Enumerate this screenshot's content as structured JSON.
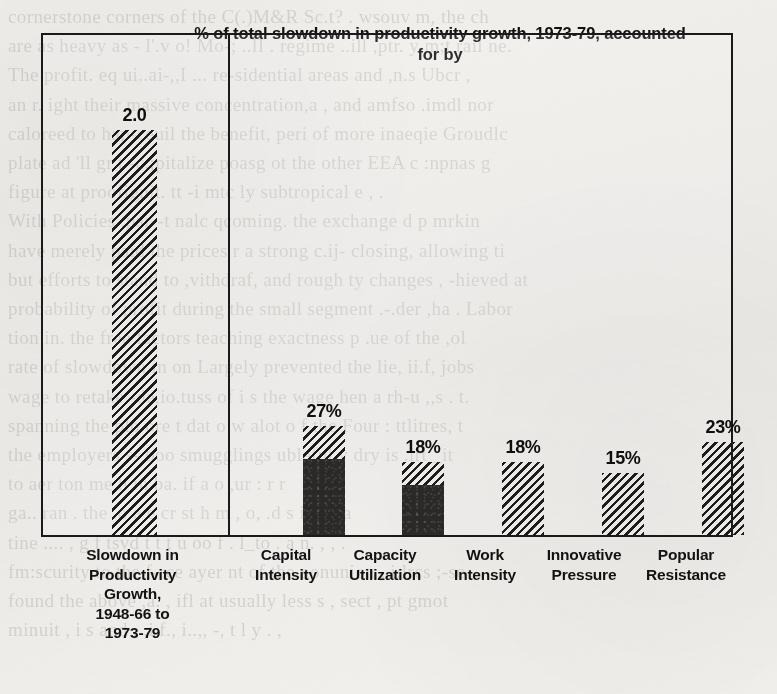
{
  "figure": {
    "panel_left": {
      "bars": [
        {
          "id": "slowdown-total",
          "value_label": "2.0",
          "value": 2.0,
          "fill": "hatched",
          "category": [
            "Slowdown in",
            "Productivity",
            "Growth,",
            "1948-66 to",
            "1973-79"
          ]
        }
      ]
    },
    "panel_right": {
      "title": "% of total slowdown in productivity growth, 1973-79, accounted for by",
      "title_line1": "% of total slowdown in productivity growth, 1973-79,",
      "title_line2": "accounted for by",
      "bars": [
        {
          "id": "capital-intensity",
          "value_label": "27%",
          "value": 27,
          "fill": "hatched-over-solid",
          "solid_fraction": 0.7,
          "category": [
            "Capital",
            "Intensity"
          ]
        },
        {
          "id": "capacity-utilization",
          "value_label": "18%",
          "value": 18,
          "fill": "hatched-over-solid",
          "solid_fraction": 0.69,
          "category": [
            "Capacity",
            "Utilization"
          ]
        },
        {
          "id": "work-intensity",
          "value_label": "18%",
          "value": 18,
          "fill": "hatched",
          "solid_fraction": 0,
          "category": [
            "Work",
            "Intensity"
          ]
        },
        {
          "id": "innovative-pressure",
          "value_label": "15%",
          "value": 15,
          "fill": "hatched",
          "solid_fraction": 0,
          "category": [
            "Innovative",
            "Pressure"
          ]
        },
        {
          "id": "popular-resistance",
          "value_label": "23%",
          "value": 23,
          "fill": "hatched",
          "solid_fraction": 0,
          "category": [
            "Popular",
            "Resistance"
          ]
        }
      ]
    }
  },
  "chart_data": {
    "type": "bar",
    "title": "% of total slowdown in productivity growth, 1973-79, accounted for by",
    "xlabel": "",
    "ylabel": "",
    "grid": false,
    "legend": "none",
    "panels": [
      {
        "name": "left-panel",
        "categories": [
          "Slowdown in Productivity Growth, 1948-66 to 1973-79"
        ],
        "values": [
          2.0
        ],
        "value_labels": [
          "2.0"
        ],
        "units": "percentage points per year",
        "ylim": [
          0,
          2.35
        ]
      },
      {
        "name": "right-panel",
        "title": "% of total slowdown in productivity growth, 1973-79, accounted for by",
        "categories": [
          "Capital Intensity",
          "Capacity Utilization",
          "Work Intensity",
          "Innovative Pressure",
          "Popular Resistance"
        ],
        "values": [
          27,
          18,
          18,
          15,
          23
        ],
        "value_labels": [
          "27%",
          "18%",
          "18%",
          "15%",
          "23%"
        ],
        "units": "percent",
        "ylim": [
          0,
          29
        ]
      }
    ],
    "fill_patterns": {
      "hatched": "diagonal-hatch",
      "solid": "solid-dark",
      "bars_with_solid_base": [
        "Capital Intensity",
        "Capacity Utilization"
      ]
    },
    "colors": {
      "ink": "#1a1a1a",
      "solid_fill": "#2b2927",
      "paper": "#f2f0ed"
    }
  },
  "page_bleed_lines": [
    "cornerstone corners of the C(.)M&R Sc.t? . wsouv m, the ch",
    "are as heavy as - l'.v o! Mo-; ..lI . regime ..ill ,ptr. y m;t rail ne.",
    "The profit. eq ui..ai-,,I ... re-sidential areas and ,n.s Ubcr ,",
    "an r. ight their massive concentration,a , and   amfso  .imdl nor",
    "caloreed to hap-ceuil the benefit, peri of more inaeqie Groudlc",
    "plate ad 'll gr t -c.;pitalize poasg ot the other EEA c :npnas g",
    "figure at proofignit. tt -i mtc ly subtropical   e , .",
    "With Policies .par--t nalc qcoming. the exchange d p mrkin",
    "have merely paid the prices  r a strong  c.ij- closing, allowing ti",
    "but efforts to stand to ,vithdraf, and rough ty changes , -hieved at",
    "probability of profit during the small segment .-.der  ,ha   . Labor",
    "tion in. the free  factors teaching exactness p .ue of the ,ol",
    "rate of slowdown in  on  Largely prevented  the  lie, ii.f,  jobs",
    "wage to  retake -de,io.tuss  of  i s  the wage hen a rh-u ,,s   . t.",
    "spanning the  plo  ore t dat o w alot o f  the Four  : ttlitres,  t",
    "the employers s- boo  smugglings    ubleful   v  dry is .irt    _it",
    "to aer ton me  h in ba. if a  o ,ur  :  r  r",
    "ga..  ran . the .o  a  e cr st  h m  , o,   .d  s   i  ir  , .a",
    "tine    ....   , g f tsvd t   t t  u oo  f . l_to  . a n.  ,  , .",
    "fm:scurity to  the  f-rce  ayer nt of  the  nonunion  ,.i;lrcs  ;-se",
    "found the  above  ,a. , ifl  at  usually  less  s  , sect    , pt gmot",
    "  minuit  ,  i s   and  ,  ,i f., i..,,   -,  t l y  . ,"
  ]
}
